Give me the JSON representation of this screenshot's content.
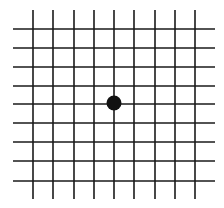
{
  "diagram": {
    "type": "amsler-grid",
    "width": 224,
    "height": 208,
    "background": "#ffffff",
    "line_color": "#1a1a1a",
    "line_width": 1.6,
    "vertical_lines": {
      "x": [
        33,
        53,
        74,
        94,
        114,
        134,
        155,
        175,
        195
      ],
      "y_start": 10,
      "y_end": 199
    },
    "horizontal_lines": {
      "y": [
        29,
        48,
        67,
        86,
        104,
        123,
        142,
        161,
        181
      ],
      "x_start": 13,
      "x_end": 215
    },
    "center_dot": {
      "cx": 114,
      "cy": 103,
      "r": 7.5,
      "color": "#111111"
    }
  }
}
